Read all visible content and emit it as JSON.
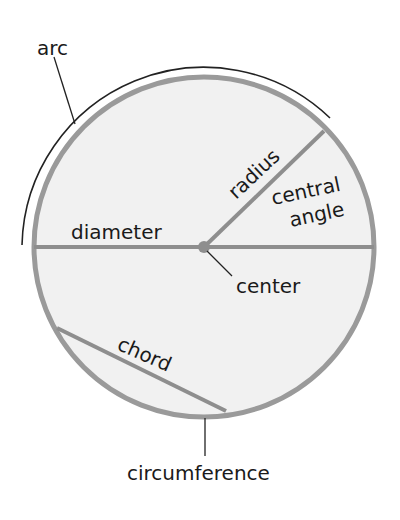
{
  "diagram": {
    "labels": {
      "arc": "arc",
      "radius": "radius",
      "central_angle_line1": "central",
      "central_angle_line2": "angle",
      "diameter": "diameter",
      "center": "center",
      "chord": "chord",
      "circumference": "circumference"
    },
    "colors": {
      "circle_fill": "#f1f1f1",
      "circle_stroke": "#9a9a9a",
      "segment_stroke": "#8e8e8e",
      "leader_line": "#222222",
      "text": "#1a1a1a"
    }
  }
}
